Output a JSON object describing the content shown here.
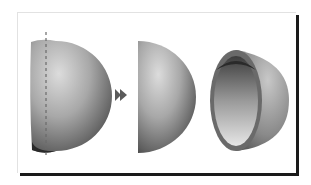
{
  "figure": {
    "steps": [
      {
        "id": "hemisphere-with-cut-line",
        "label": ""
      },
      {
        "id": "arrow",
        "label": ""
      },
      {
        "id": "hemisphere-result",
        "label": ""
      },
      {
        "id": "hollow-shell",
        "label": ""
      }
    ],
    "icons": {
      "arrow": "fast-forward-arrow-icon",
      "cut_line": "dashed-line"
    },
    "colors": {
      "frame_shadow": "#1a1a1a",
      "frame_border": "#e2e2e2",
      "arrow": "#5a5a5a",
      "shape_light": "#d6d6d6",
      "shape_dark": "#3a3a3a"
    }
  }
}
